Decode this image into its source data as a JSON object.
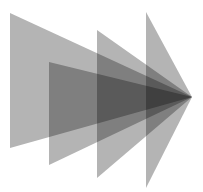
{
  "canvas": {
    "width": 203,
    "height": 192,
    "background_color": "#ffffff",
    "title": "Layered translucent triangular wedges forming a rightward arrow"
  },
  "palette": {
    "wedge_fill": "#b4b4b4",
    "single_layer_gray": "#b4b4b4",
    "two_layer_gray": "#6e6e6e",
    "three_layer_gray": "#454545",
    "four_layer_core": "#2a2a2a",
    "background": "#ffffff"
  },
  "apex": {
    "x": 192,
    "y": 97,
    "label": "shared-convergence-point"
  },
  "shapes": [
    {
      "name": "wedge-1-largest",
      "order": 1,
      "left_edge_x": 10,
      "top_y": 13,
      "bottom_y": 148,
      "fill": "#b4b4b4",
      "opacity": 1,
      "points": "10,13 192,97 10,148"
    },
    {
      "name": "wedge-2",
      "order": 2,
      "left_edge_x": 49,
      "top_y": 62,
      "bottom_y": 165,
      "fill": "#b4b4b4",
      "opacity": 1,
      "points": "49,62 192,97 49,165"
    },
    {
      "name": "wedge-3",
      "order": 3,
      "left_edge_x": 97,
      "top_y": 30,
      "bottom_y": 178,
      "fill": "#b4b4b4",
      "opacity": 1,
      "points": "97,30 192,97 97,178"
    },
    {
      "name": "wedge-4-narrowest",
      "order": 4,
      "left_edge_x": 146,
      "top_y": 12,
      "bottom_y": 188,
      "fill": "#b4b4b4",
      "opacity": 1,
      "points": "146,12 192,97 146,188"
    }
  ]
}
